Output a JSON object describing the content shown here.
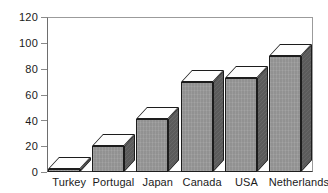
{
  "chart_data": {
    "type": "bar",
    "title": "",
    "subtitle": "",
    "xlabel": "",
    "ylabel": "",
    "categories": [
      "Turkey",
      "Portugal",
      "Japan",
      "Canada",
      "USA",
      "Netherlands"
    ],
    "values": [
      2,
      20,
      41,
      70,
      73,
      90
    ],
    "ylim": [
      0,
      120
    ],
    "yticks": [
      0,
      20,
      40,
      60,
      80,
      100,
      120
    ],
    "ytick_labels": [
      "0",
      "20",
      "40",
      "60",
      "80",
      "100",
      "120"
    ],
    "grid": false,
    "legend": null,
    "legend_position": "none",
    "style": "3d-column",
    "colors": {
      "bar_front": "#9a9a9a",
      "bar_side": "#5f5f5f",
      "bar_top": "#fdfdfd",
      "bar_outline": "#1c1c1c",
      "frame": "#9b9b9b",
      "axis": "#3a3a3a",
      "text": "#1a1a1a",
      "background": "#ffffff"
    }
  }
}
